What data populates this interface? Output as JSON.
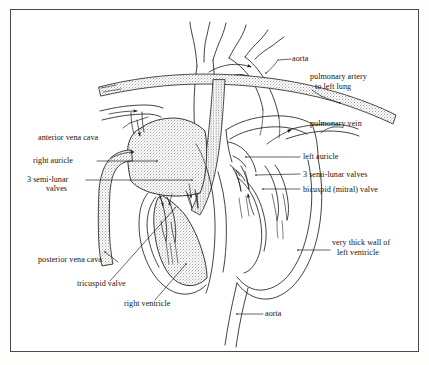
{
  "figure": {
    "type": "anatomical-diagram",
    "border_color": "#4a4a4a",
    "ink_color": "#15130f",
    "stipple_color": "#8d8d8d",
    "background": "#ffffff"
  },
  "labels": {
    "aorta_top": "aorta",
    "pulmonary_artery": "pulmonary artery",
    "pulmonary_artery_2": "to left lung",
    "pulmonary_vein": "pulmonary vein",
    "anterior_vena_cava": "anterior vena cava",
    "left_auricle": "left auricle",
    "right_auricle": "right auricle",
    "semilunar_right_1": "3 semi-lunar",
    "semilunar_right_2": "valves",
    "semilunar_left": "3 semi-lunar valves",
    "bicuspid_valve": "bicuspid (mitral) valve",
    "thick_wall_1": "very thick wall of",
    "thick_wall_2": "left ventricle",
    "posterior_vena_cava": "posterior vena cava",
    "tricuspid_valve": "tricuspid valve",
    "right_ventricle": "right ventricle",
    "aorta_bottom": "aorta"
  }
}
